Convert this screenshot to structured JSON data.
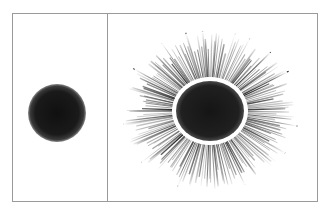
{
  "figure": {
    "frame": {
      "x": 12,
      "y": 13,
      "width": 305,
      "height": 188,
      "stroke": "#9a9a9a"
    },
    "divider_x": 107,
    "panels": [
      {
        "name": "left-panel",
        "blob": {
          "cx": 57,
          "cy": 113,
          "r": 29,
          "color": "#161616"
        }
      },
      {
        "name": "right-panel",
        "blob": {
          "cx": 210,
          "cy": 111,
          "rx": 34,
          "ry": 30,
          "color": "#1a1a1a"
        },
        "halo": {
          "color": "#ffffff",
          "width": 3
        },
        "rays": {
          "count": 180,
          "outer_rx": 86,
          "outer_ry": 78,
          "inner_rx": 38,
          "inner_ry": 34,
          "color": "#2a2a2a"
        }
      }
    ]
  }
}
